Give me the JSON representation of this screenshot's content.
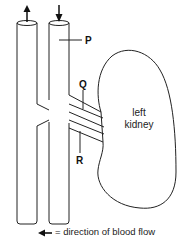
{
  "diagram": {
    "labels": {
      "P": "P",
      "Q": "Q",
      "R": "R"
    },
    "organ": {
      "line1": "left",
      "line2": "kidney"
    },
    "legend": {
      "arrow_icon": "left-arrow",
      "text": "= direction of blood flow"
    },
    "colors": {
      "stroke": "#222222",
      "background": "#ffffff"
    }
  }
}
